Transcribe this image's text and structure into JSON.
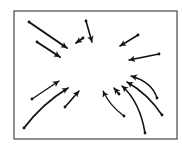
{
  "diagram": {
    "title": "Arrows converging toward center",
    "frame": {
      "x": 14,
      "y": 11,
      "width": 163,
      "height": 128,
      "stroke": "#555555"
    },
    "arrow_color": "#111111",
    "arrows": [
      {
        "id": "a1",
        "from": [
          29,
          22
        ],
        "to": [
          67,
          48
        ],
        "ctrl": null,
        "width": 2.0
      },
      {
        "id": "a2",
        "from": [
          37,
          42
        ],
        "to": [
          60,
          57
        ],
        "ctrl": null,
        "width": 2.0
      },
      {
        "id": "a3",
        "from": [
          83,
          38
        ],
        "to": [
          76,
          43
        ],
        "ctrl": null,
        "width": 2.0
      },
      {
        "id": "a4",
        "from": [
          86,
          21
        ],
        "to": [
          92,
          42
        ],
        "ctrl": null,
        "width": 1.6
      },
      {
        "id": "a5",
        "from": [
          138,
          35
        ],
        "to": [
          120,
          46
        ],
        "ctrl": null,
        "width": 1.6
      },
      {
        "id": "a6",
        "from": [
          159,
          54
        ],
        "to": [
          129,
          60
        ],
        "ctrl": null,
        "width": 1.4
      },
      {
        "id": "a7",
        "from": [
          32,
          99
        ],
        "to": [
          59,
          81
        ],
        "ctrl": null,
        "width": 1.4
      },
      {
        "id": "a8",
        "from": [
          24,
          128
        ],
        "to": [
          68,
          88
        ],
        "ctrl": [
          42,
          104
        ],
        "width": 1.8
      },
      {
        "id": "a9",
        "from": [
          65,
          107
        ],
        "to": [
          79,
          91
        ],
        "ctrl": null,
        "width": 1.6
      },
      {
        "id": "a10",
        "from": [
          124,
          116
        ],
        "to": [
          103,
          91
        ],
        "ctrl": [
          110,
          106
        ],
        "width": 1.2
      },
      {
        "id": "a11",
        "from": [
          119,
          94
        ],
        "to": [
          114,
          88
        ],
        "ctrl": null,
        "width": 1.6
      },
      {
        "id": "a12",
        "from": [
          145,
          133
        ],
        "to": [
          122,
          86
        ],
        "ctrl": [
          140,
          102
        ],
        "width": 1.6
      },
      {
        "id": "a13",
        "from": [
          162,
          115
        ],
        "to": [
          127,
          82
        ],
        "ctrl": [
          148,
          94
        ],
        "width": 1.6
      },
      {
        "id": "a14",
        "from": [
          157,
          98
        ],
        "to": [
          131,
          76
        ],
        "ctrl": [
          152,
          82
        ],
        "width": 1.4
      }
    ]
  }
}
